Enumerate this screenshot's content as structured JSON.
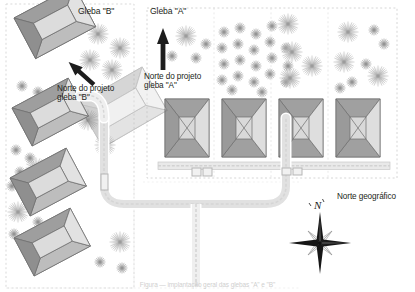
{
  "document": {
    "title": "Planta de situação — Gleba \"A\" e Gleba \"B\"",
    "caption": "Figura — implantação geral das glebas \"A\" e \"B\""
  },
  "labels": {
    "gleba_b": "Gleba \"B\"",
    "gleba_a": "Gleba \"A\"",
    "norte_projeto_b": "Norte do projeto\ngleba \"B\"",
    "norte_projeto_a": "Norte do projeto\ngleba \"A\"",
    "norte_geografico": "Norte geográfico",
    "compass_letter": "N"
  },
  "colors": {
    "text": "#231f20",
    "roof_dark": "#9a9a9a",
    "roof_light": "#d8d8d8",
    "roof_mid": "#bdbdbd",
    "outline": "#6f6f6f",
    "road_fill": "#ededed",
    "road_edge": "#bcbcbc",
    "tree": "#b9b9b9",
    "parcel_border": "#d6d6d6",
    "compass_dark": "#1a1a1a",
    "compass_light": "#e2e2e2"
  },
  "parcels": [
    {
      "id": "gleba-b",
      "name": "Gleba \"B\"",
      "x": 6,
      "y": 4,
      "width": 128,
      "height": 284,
      "north_arrow": "northwest"
    },
    {
      "id": "gleba-a",
      "name": "Gleba \"A\"",
      "x": 143,
      "y": 4,
      "width": 258,
      "height": 178,
      "north_arrow": "north"
    }
  ],
  "buildings_gleba_b": [
    {
      "id": "b1",
      "cx": 52,
      "cy": 46,
      "rotation": -28
    },
    {
      "id": "b2",
      "cx": 47,
      "cy": 128,
      "rotation": -28
    },
    {
      "id": "b3",
      "cx": 47,
      "cy": 197,
      "rotation": -28
    },
    {
      "id": "b4",
      "cx": 52,
      "cy": 258,
      "rotation": -28
    },
    {
      "id": "b5-ghost",
      "cx": 110,
      "cy": 130,
      "rotation": -28
    }
  ],
  "buildings_gleba_a": [
    {
      "id": "a1",
      "x": 165,
      "y": 99,
      "width": 44,
      "height": 58
    },
    {
      "id": "a2",
      "x": 222,
      "y": 99,
      "width": 44,
      "height": 58
    },
    {
      "id": "a3",
      "x": 279,
      "y": 99,
      "width": 44,
      "height": 58
    },
    {
      "id": "a4",
      "x": 336,
      "y": 99,
      "width": 44,
      "height": 58
    }
  ],
  "tree_groups": [
    {
      "id": "tg-b-top",
      "count": 6,
      "region": "gleba-b-top"
    },
    {
      "id": "tg-b-mid",
      "count": 9,
      "region": "gleba-b-middle"
    },
    {
      "id": "tg-b-low",
      "count": 10,
      "region": "gleba-b-lower"
    },
    {
      "id": "tg-a-1",
      "count": 5,
      "region": "gleba-a-col1"
    },
    {
      "id": "tg-a-2",
      "count": 22,
      "region": "gleba-a-col2"
    },
    {
      "id": "tg-a-3",
      "count": 5,
      "region": "gleba-a-col3"
    },
    {
      "id": "tg-a-4",
      "count": 9,
      "region": "gleba-a-col4"
    }
  ],
  "roads": {
    "main_loop": "U-shaped access road connecting gleba B to gleba A",
    "stem": "south branch from loop center",
    "internal_band": "long horizontal service strip below gleba A buildings"
  },
  "compass": {
    "type": "8-point star rose",
    "cx": 320,
    "cy": 243,
    "letter": "N",
    "caption": "Norte geográfico"
  }
}
